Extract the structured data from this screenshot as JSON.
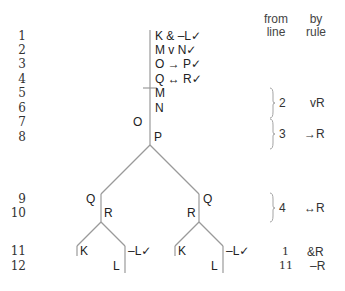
{
  "header": {
    "from_line": [
      "from",
      "line"
    ],
    "by_rule": [
      "by",
      "rule"
    ]
  },
  "line_numbers": [
    "1",
    "2",
    "3",
    "4",
    "5",
    "6",
    "7",
    "8",
    "9",
    "10",
    "11",
    "12"
  ],
  "trunk": {
    "premises": [
      "K & –L✓",
      "M v N✓",
      "O → P✓",
      "Q ↔ R✓"
    ],
    "line5": "M",
    "line6": "N",
    "line7_left": "O",
    "line8_right": "P"
  },
  "branches": {
    "left": {
      "line9": "Q",
      "line10": "R",
      "line11_left": "K",
      "line11_right": "–L✓",
      "line12": "L"
    },
    "right": {
      "line9": "Q",
      "line10": "R",
      "line11_left": "K",
      "line11_right": "–L✓",
      "line12": "L"
    }
  },
  "justifications": [
    {
      "lines": "5-6",
      "from": "2",
      "rule": "vR"
    },
    {
      "lines": "7-8",
      "from": "3",
      "rule": "→R"
    },
    {
      "lines": "9-10",
      "from": "4",
      "rule": "↔R"
    },
    {
      "lines": "11",
      "from": "1",
      "rule": "&R"
    },
    {
      "lines": "12",
      "from": "11",
      "rule": "–R"
    }
  ],
  "colors": {
    "line": "#9a9a9a",
    "text": "#222222"
  }
}
